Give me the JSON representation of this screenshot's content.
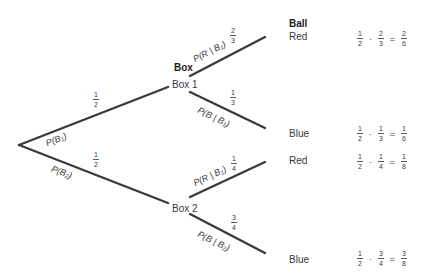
{
  "headers": {
    "box": "Box",
    "ball": "Ball"
  },
  "nodes": {
    "box1": "Box 1",
    "box2": "Box 2",
    "box1_red": "Red",
    "box1_blue": "Blue",
    "box2_red": "Red",
    "box2_blue": "Blue"
  },
  "edges": {
    "root_box1": {
      "label_main": "P(B",
      "label_sub": "1",
      "label_end": ")",
      "prob_num": "1",
      "prob_den": "2"
    },
    "root_box2": {
      "label_main": "P(B",
      "label_sub": "2",
      "label_end": ")",
      "prob_num": "1",
      "prob_den": "2"
    },
    "box1_red": {
      "label_main": "P(R | B",
      "label_sub": "1",
      "label_end": ")",
      "prob_num": "2",
      "prob_den": "3"
    },
    "box1_blue": {
      "label_main": "P(B | B",
      "label_sub": "1",
      "label_end": ")",
      "prob_num": "1",
      "prob_den": "3"
    },
    "box2_red": {
      "label_main": "P(R | B",
      "label_sub": "1",
      "label_end": ")",
      "prob_num": "1",
      "prob_den": "4",
      "note": "Rendered as B1 in source image; logically this edge should read P(R | B2) since it branches from Box 2."
    },
    "box2_blue": {
      "label_main": "P(B | B",
      "label_sub": "2",
      "label_end": ")",
      "prob_num": "3",
      "prob_den": "4"
    }
  },
  "products": [
    {
      "a_num": "1",
      "a_den": "2",
      "b_num": "2",
      "b_den": "3",
      "r_num": "2",
      "r_den": "6",
      "dot": "·",
      "eq": "="
    },
    {
      "a_num": "1",
      "a_den": "2",
      "b_num": "1",
      "b_den": "3",
      "r_num": "1",
      "r_den": "6",
      "dot": "·",
      "eq": "="
    },
    {
      "a_num": "1",
      "a_den": "2",
      "b_num": "1",
      "b_den": "4",
      "r_num": "1",
      "r_den": "8",
      "dot": "·",
      "eq": "="
    },
    {
      "a_num": "1",
      "a_den": "2",
      "b_num": "3",
      "b_den": "4",
      "r_num": "3",
      "r_den": "8",
      "dot": "·",
      "eq": "="
    }
  ],
  "colors": {
    "line": "#3a3a3a",
    "text": "#3a3a3a",
    "header": "#1e1e1e",
    "background": "#ffffff"
  }
}
